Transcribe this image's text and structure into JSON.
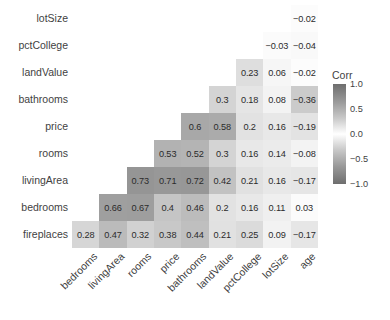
{
  "chart_data": {
    "type": "heatmap",
    "title": "",
    "xlabel": "",
    "ylabel": "",
    "legend_title": "Corr",
    "legend_position": "right",
    "grid": false,
    "zlim": [
      -1.0,
      1.0
    ],
    "legend_ticks": [
      "1.0",
      "0.5",
      "0.0",
      "-0.5",
      "-1.0"
    ],
    "legend_tick_values": [
      1.0,
      0.5,
      0.0,
      -0.5,
      -1.0
    ],
    "colormap": "grey-diverging-abs",
    "shape": "lower-triangular",
    "x_categories": [
      "bedrooms",
      "livingArea",
      "rooms",
      "price",
      "bathrooms",
      "landValue",
      "pctCollege",
      "lotSize",
      "age"
    ],
    "y_categories": [
      "lotSize",
      "pctCollege",
      "landValue",
      "bathrooms",
      "price",
      "rooms",
      "livingArea",
      "bedrooms",
      "fireplaces"
    ],
    "rows": [
      {
        "label": "lotSize",
        "cells": [
          null,
          null,
          null,
          null,
          null,
          null,
          null,
          null,
          -0.02
        ],
        "text": [
          "",
          "",
          "",
          "",
          "",
          "",
          "",
          "",
          "−0.02"
        ]
      },
      {
        "label": "pctCollege",
        "cells": [
          null,
          null,
          null,
          null,
          null,
          null,
          null,
          -0.03,
          -0.04
        ],
        "text": [
          "",
          "",
          "",
          "",
          "",
          "",
          "",
          "−0.03",
          "−0.04"
        ]
      },
      {
        "label": "landValue",
        "cells": [
          null,
          null,
          null,
          null,
          null,
          null,
          0.23,
          0.06,
          -0.02
        ],
        "text": [
          "",
          "",
          "",
          "",
          "",
          "",
          "0.23",
          "0.06",
          "−0.02"
        ]
      },
      {
        "label": "bathrooms",
        "cells": [
          null,
          null,
          null,
          null,
          null,
          0.3,
          0.18,
          0.08,
          -0.36
        ],
        "text": [
          "",
          "",
          "",
          "",
          "",
          "0.3",
          "0.18",
          "0.08",
          "−0.36"
        ]
      },
      {
        "label": "price",
        "cells": [
          null,
          null,
          null,
          null,
          0.6,
          0.58,
          0.2,
          0.16,
          -0.19
        ],
        "text": [
          "",
          "",
          "",
          "",
          "0.6",
          "0.58",
          "0.2",
          "0.16",
          "−0.19"
        ]
      },
      {
        "label": "rooms",
        "cells": [
          null,
          null,
          null,
          0.53,
          0.52,
          0.3,
          0.16,
          0.14,
          -0.08
        ],
        "text": [
          "",
          "",
          "",
          "0.53",
          "0.52",
          "0.3",
          "0.16",
          "0.14",
          "−0.08"
        ]
      },
      {
        "label": "livingArea",
        "cells": [
          null,
          null,
          0.73,
          0.71,
          0.72,
          0.42,
          0.21,
          0.16,
          -0.17
        ],
        "text": [
          "",
          "",
          "0.73",
          "0.71",
          "0.72",
          "0.42",
          "0.21",
          "0.16",
          "−0.17"
        ]
      },
      {
        "label": "bedrooms",
        "cells": [
          null,
          0.66,
          0.67,
          0.4,
          0.46,
          0.2,
          0.16,
          0.11,
          0.03
        ],
        "text": [
          "",
          "0.66",
          "0.67",
          "0.4",
          "0.46",
          "0.2",
          "0.16",
          "0.11",
          "0.03"
        ]
      },
      {
        "label": "fireplaces",
        "cells": [
          0.28,
          0.47,
          0.32,
          0.38,
          0.44,
          0.21,
          0.25,
          0.09,
          -0.17
        ],
        "text": [
          "0.28",
          "0.47",
          "0.32",
          "0.38",
          "0.44",
          "0.21",
          "0.25",
          "0.09",
          "−0.17"
        ]
      }
    ]
  },
  "colors": {
    "text": "#3f3f3f",
    "cell_text": "#2b2b2b",
    "background": "#ffffff",
    "scale_extreme": "#6e6e6e",
    "scale_zero": "#ffffff"
  }
}
